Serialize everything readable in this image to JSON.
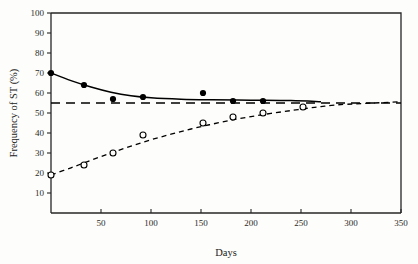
{
  "chart_data": {
    "type": "line",
    "title": "",
    "xlabel": "Days",
    "ylabel": "Frequency of ST (%)",
    "xlim": [
      0,
      350
    ],
    "ylim": [
      0,
      100
    ],
    "xticks": [
      50,
      100,
      150,
      200,
      250,
      300,
      350
    ],
    "yticks": [
      10,
      20,
      30,
      40,
      50,
      60,
      70,
      80,
      90,
      100
    ],
    "grid": false,
    "legend": "none",
    "series": [
      {
        "name": "filled-circles",
        "marker": "filled-circle",
        "linestyle": "solid",
        "color": "#000000",
        "points": [
          {
            "x": 0,
            "y": 70
          },
          {
            "x": 33,
            "y": 64
          },
          {
            "x": 62,
            "y": 57
          },
          {
            "x": 92,
            "y": 58
          },
          {
            "x": 152,
            "y": 60
          },
          {
            "x": 182,
            "y": 56
          },
          {
            "x": 212,
            "y": 56
          }
        ],
        "curve": [
          {
            "x": 0,
            "y": 70.0
          },
          {
            "x": 20,
            "y": 66.2
          },
          {
            "x": 40,
            "y": 63.0
          },
          {
            "x": 60,
            "y": 60.4
          },
          {
            "x": 80,
            "y": 58.6
          },
          {
            "x": 100,
            "y": 57.6
          },
          {
            "x": 130,
            "y": 56.9
          },
          {
            "x": 160,
            "y": 56.6
          },
          {
            "x": 200,
            "y": 56.4
          },
          {
            "x": 240,
            "y": 56.2
          },
          {
            "x": 270,
            "y": 55.6
          }
        ]
      },
      {
        "name": "open-circles",
        "marker": "open-circle",
        "linestyle": "dashed",
        "color": "#000000",
        "points": [
          {
            "x": 0,
            "y": 19
          },
          {
            "x": 33,
            "y": 24
          },
          {
            "x": 62,
            "y": 30
          },
          {
            "x": 92,
            "y": 39
          },
          {
            "x": 152,
            "y": 45
          },
          {
            "x": 182,
            "y": 48
          },
          {
            "x": 212,
            "y": 50
          },
          {
            "x": 252,
            "y": 53
          }
        ],
        "curve": [
          {
            "x": 0,
            "y": 19.0
          },
          {
            "x": 20,
            "y": 22.6
          },
          {
            "x": 40,
            "y": 26.4
          },
          {
            "x": 60,
            "y": 30.0
          },
          {
            "x": 80,
            "y": 33.4
          },
          {
            "x": 100,
            "y": 36.6
          },
          {
            "x": 120,
            "y": 39.4
          },
          {
            "x": 140,
            "y": 42.0
          },
          {
            "x": 160,
            "y": 44.3
          },
          {
            "x": 180,
            "y": 46.4
          },
          {
            "x": 200,
            "y": 48.2
          },
          {
            "x": 220,
            "y": 49.8
          },
          {
            "x": 240,
            "y": 51.2
          },
          {
            "x": 260,
            "y": 52.6
          },
          {
            "x": 270,
            "y": 53.2
          },
          {
            "x": 290,
            "y": 54.2
          },
          {
            "x": 350,
            "y": 55.6
          }
        ]
      }
    ],
    "reference_line": {
      "name": "equilibrium-line",
      "y": 55,
      "linestyle": "dashed",
      "color": "#000000"
    }
  }
}
